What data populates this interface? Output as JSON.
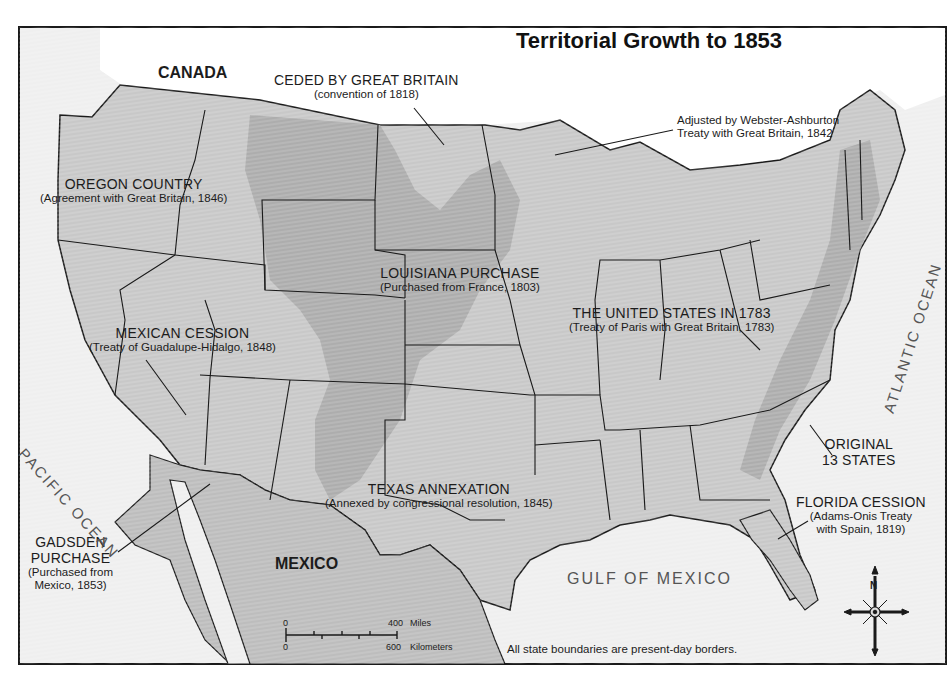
{
  "map": {
    "title": "Territorial Growth to 1853",
    "regions": {
      "ceded_gb": {
        "name": "CEDED BY GREAT BRITAIN",
        "detail": "(convention of 1818)"
      },
      "webster": {
        "line1": "Adjusted by Webster-Ashburton",
        "line2": "Treaty with Great Britain, 1842"
      },
      "oregon": {
        "name": "OREGON COUNTRY",
        "detail": "(Agreement with Great Britain, 1846)"
      },
      "louisiana": {
        "name": "LOUISIANA PURCHASE",
        "detail": "(Purchased from France, 1803)"
      },
      "us1783": {
        "name": "THE UNITED STATES IN 1783",
        "detail": "(Treaty of Paris with Great Britain, 1783)"
      },
      "mexican": {
        "name": "MEXICAN CESSION",
        "detail": "(Treaty of Guadalupe-Hidalgo, 1848)"
      },
      "original13": {
        "line1": "ORIGINAL",
        "line2": "13 STATES"
      },
      "texas": {
        "name": "TEXAS ANNEXATION",
        "detail": "(Annexed by congressional resolution, 1845)"
      },
      "florida": {
        "name": "FLORIDA CESSION",
        "detail1": "(Adams-Onis Treaty",
        "detail2": "with Spain, 1819)"
      },
      "gadsden": {
        "line1": "GADSDEN",
        "line2": "PURCHASE",
        "detail1": "(Purchased from",
        "detail2": "Mexico, 1853)"
      }
    },
    "countries": {
      "canada": "CANADA",
      "mexico": "MEXICO"
    },
    "water": {
      "pacific": "PACIFIC OCEAN",
      "atlantic": "ATLANTIC OCEAN",
      "gulf": "GULF OF MEXICO"
    },
    "scale": {
      "miles_zero": "0",
      "miles_max": "400",
      "miles_unit": "Miles",
      "km_zero": "0",
      "km_max": "600",
      "km_unit": "Kilometers"
    },
    "compass": {
      "north": "N"
    },
    "footnote": "All state boundaries are present-day borders.",
    "colors": {
      "land_light": "#d4d4d4",
      "land_mid": "#b9b9b9",
      "land_dark": "#9d9d9d",
      "water": "#f3f3f3",
      "border": "#1a1a1a"
    }
  }
}
